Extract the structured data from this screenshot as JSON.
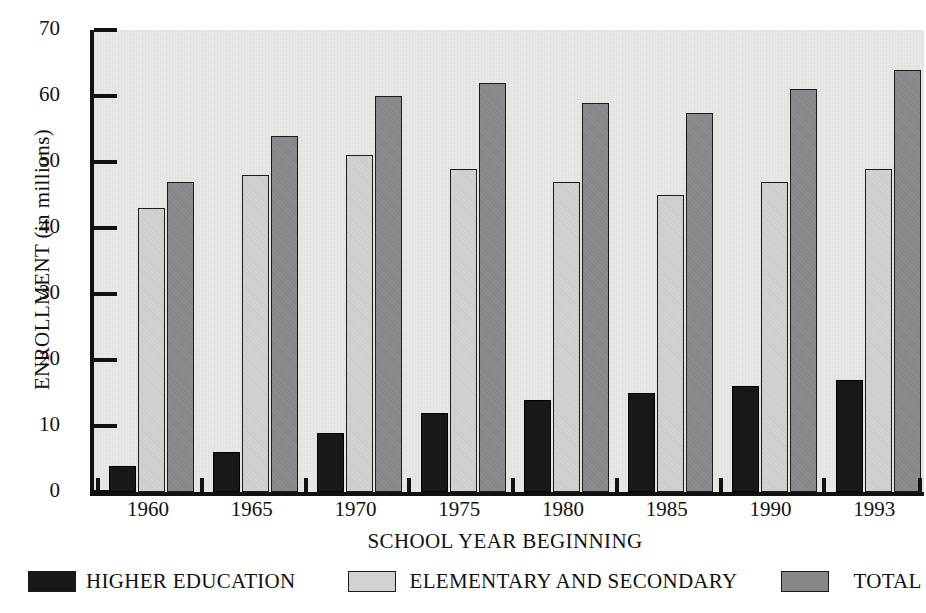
{
  "chart_data": {
    "type": "bar",
    "title": "",
    "xlabel": "SCHOOL YEAR BEGINNING",
    "ylabel": "ENROLLMENT (in millions)",
    "categories": [
      "1960",
      "1965",
      "1970",
      "1975",
      "1980",
      "1985",
      "1990",
      "1993"
    ],
    "series": [
      {
        "name": "HIGHER EDUCATION",
        "key": "he",
        "color": "#181818",
        "values": [
          4,
          6,
          9,
          12,
          14,
          15,
          16,
          17
        ]
      },
      {
        "name": "ELEMENTARY AND SECONDARY",
        "key": "es",
        "color": "#d2d2d0",
        "values": [
          43,
          48,
          51,
          49,
          47,
          45,
          47,
          49
        ]
      },
      {
        "name": "TOTAL",
        "key": "tt",
        "color": "#87878a",
        "values": [
          47,
          54,
          60,
          62,
          59,
          57.5,
          61,
          64
        ]
      }
    ],
    "ylim": [
      0,
      70
    ],
    "yticks": [
      0,
      10,
      20,
      30,
      40,
      50,
      60,
      70
    ],
    "ytick_labels": [
      "0",
      "10",
      "20",
      "30",
      "40",
      "50",
      "60",
      "70"
    ],
    "grid": false,
    "legend_position": "bottom",
    "plot_background": "#e9e9e7",
    "axis_color": "#111111"
  },
  "legend": {
    "items": [
      {
        "label": "HIGHER EDUCATION",
        "color": "#181818"
      },
      {
        "label": "ELEMENTARY AND SECONDARY",
        "color": "#d2d2d0"
      },
      {
        "label": "TOTAL",
        "color": "#87878a"
      }
    ]
  }
}
